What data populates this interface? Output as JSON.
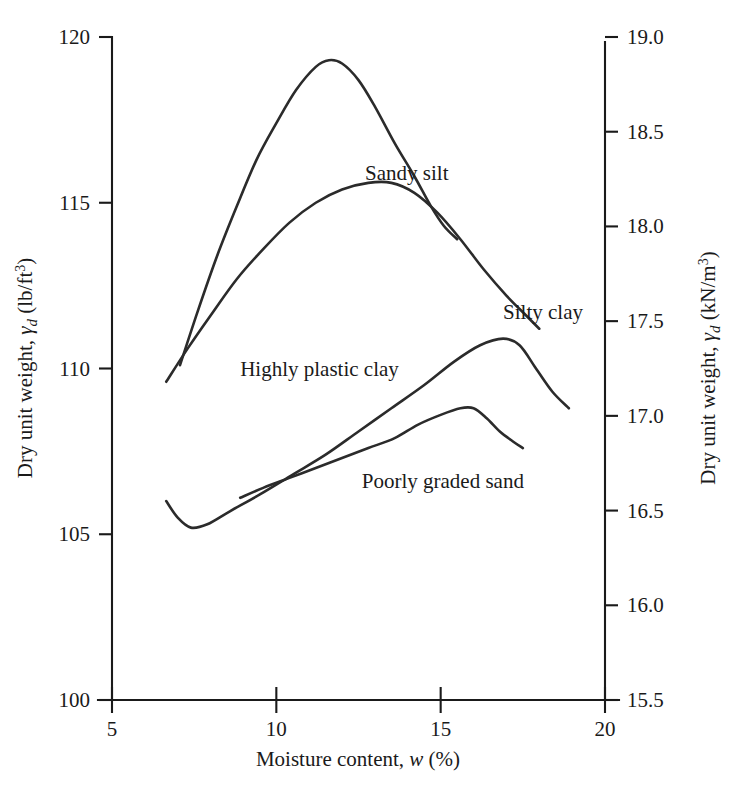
{
  "chart_data": {
    "type": "line",
    "title": "",
    "xlabel": "Moisture content, w (%)",
    "ylabel": "Dry unit weight, γd (lb/ft3)",
    "ylabel_right": "Dry unit weight, γd (kN/m3)",
    "xlim": [
      5,
      20
    ],
    "ylim": [
      100,
      120
    ],
    "ylim_right": [
      15.5,
      19.0
    ],
    "xticks": [
      5,
      10,
      15,
      20
    ],
    "xtick_labels": [
      "5",
      "10",
      "15",
      "20"
    ],
    "yticks": [
      100,
      105,
      110,
      115,
      120
    ],
    "ytick_labels": [
      "100",
      "105",
      "110",
      "115",
      "120"
    ],
    "yticks_right": [
      15.5,
      16.0,
      16.5,
      17.0,
      17.5,
      18.0,
      18.5,
      19.0
    ],
    "ytick_labels_right": [
      "15.5",
      "16.0",
      "16.5",
      "17.0",
      "17.5",
      "18.0",
      "18.5",
      "19.0"
    ],
    "grid": false,
    "legend_position": "inline-annotations",
    "series": [
      {
        "name": "Sandy silt",
        "label_x": 12.7,
        "label_y": 115.9,
        "points": [
          [
            7.07,
            110.1
          ],
          [
            7.6,
            111.7
          ],
          [
            8.2,
            113.4
          ],
          [
            8.8,
            114.9
          ],
          [
            9.4,
            116.3
          ],
          [
            10.0,
            117.4
          ],
          [
            10.6,
            118.4
          ],
          [
            11.2,
            119.1
          ],
          [
            11.6,
            119.3
          ],
          [
            12.0,
            119.2
          ],
          [
            12.5,
            118.7
          ],
          [
            13.0,
            117.9
          ],
          [
            13.6,
            116.8
          ],
          [
            14.2,
            115.8
          ],
          [
            14.7,
            114.9
          ],
          [
            15.1,
            114.3
          ],
          [
            15.5,
            113.9
          ]
        ]
      },
      {
        "name": "Silty clay",
        "label_x": 16.9,
        "label_y": 111.7,
        "points": [
          [
            6.65,
            109.6
          ],
          [
            7.3,
            110.6
          ],
          [
            8.0,
            111.6
          ],
          [
            8.8,
            112.7
          ],
          [
            9.6,
            113.6
          ],
          [
            10.4,
            114.4
          ],
          [
            11.2,
            115.0
          ],
          [
            12.0,
            115.4
          ],
          [
            12.8,
            115.6
          ],
          [
            13.5,
            115.6
          ],
          [
            14.2,
            115.3
          ],
          [
            14.9,
            114.7
          ],
          [
            15.6,
            113.9
          ],
          [
            16.3,
            113.0
          ],
          [
            17.0,
            112.2
          ],
          [
            17.6,
            111.6
          ],
          [
            18.0,
            111.2
          ]
        ]
      },
      {
        "name": "Highly plastic clay",
        "label_x": 8.9,
        "label_y": 110.0,
        "points": [
          [
            6.65,
            106.0
          ],
          [
            7.0,
            105.5
          ],
          [
            7.4,
            105.2
          ],
          [
            7.9,
            105.3
          ],
          [
            8.6,
            105.7
          ],
          [
            9.5,
            106.2
          ],
          [
            10.5,
            106.8
          ],
          [
            11.5,
            107.4
          ],
          [
            12.5,
            108.1
          ],
          [
            13.5,
            108.8
          ],
          [
            14.5,
            109.5
          ],
          [
            15.4,
            110.2
          ],
          [
            16.2,
            110.7
          ],
          [
            16.9,
            110.9
          ],
          [
            17.4,
            110.7
          ],
          [
            17.9,
            110.0
          ],
          [
            18.4,
            109.3
          ],
          [
            18.9,
            108.8
          ]
        ]
      },
      {
        "name": "Poorly graded sand",
        "label_x": 12.6,
        "label_y": 106.6,
        "points": [
          [
            8.9,
            106.1
          ],
          [
            9.6,
            106.4
          ],
          [
            10.4,
            106.7
          ],
          [
            11.2,
            107.0
          ],
          [
            12.0,
            107.3
          ],
          [
            12.8,
            107.6
          ],
          [
            13.6,
            107.9
          ],
          [
            14.3,
            108.3
          ],
          [
            15.0,
            108.6
          ],
          [
            15.6,
            108.8
          ],
          [
            16.0,
            108.8
          ],
          [
            16.4,
            108.5
          ],
          [
            16.8,
            108.1
          ],
          [
            17.2,
            107.8
          ],
          [
            17.5,
            107.6
          ]
        ]
      }
    ]
  },
  "axes": {
    "x_title_main": "Moisture content,",
    "x_title_var": "w",
    "x_title_unit": "(%)",
    "y_left_main": "Dry unit weight,",
    "y_left_gamma": "γ",
    "y_left_sub": "d",
    "y_left_unit_open": "(lb/ft",
    "y_left_unit_sup": "3",
    "y_left_unit_close": ")",
    "y_right_main": "Dry unit weight,",
    "y_right_gamma": "γ",
    "y_right_sub": "d",
    "y_right_unit_open": "(kN/m",
    "y_right_unit_sup": "3",
    "y_right_unit_close": ")"
  }
}
